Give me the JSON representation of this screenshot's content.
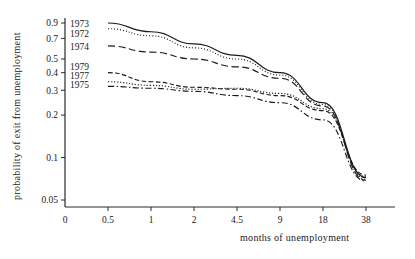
{
  "chart_data": {
    "type": "line",
    "title": "",
    "xlabel": "months of unemployment",
    "ylabel": "probability of exit from unemployment",
    "x_tick_labels": [
      "0",
      "0.5",
      "1",
      "2",
      "4.5",
      "9",
      "18",
      "38"
    ],
    "x_scale": "categorical-ordinal",
    "y_scale": "log",
    "y_tick_labels": [
      "0.9",
      "0.7",
      "0.5",
      "0.4",
      "0.3",
      "0.2",
      "0.1",
      "0.05"
    ],
    "y_tick_values": [
      0.9,
      0.7,
      0.5,
      0.4,
      0.3,
      0.2,
      0.1,
      0.05
    ],
    "ylim": [
      0.04,
      1.0
    ],
    "grid": false,
    "legend_position": "inline-left-of-curves",
    "categories": [
      "0.5",
      "1",
      "2",
      "4.5",
      "9",
      "18",
      "38"
    ],
    "series": [
      {
        "name": "1973",
        "style": "solid",
        "label": "1973",
        "values": [
          0.9,
          0.78,
          0.64,
          0.53,
          0.4,
          0.245,
          0.072
        ]
      },
      {
        "name": "1972",
        "style": "dotted",
        "label": "1972",
        "values": [
          0.82,
          0.73,
          0.6,
          0.5,
          0.385,
          0.238,
          0.07
        ]
      },
      {
        "name": "1974",
        "style": "long-dashed",
        "label": "1974",
        "values": [
          0.62,
          0.56,
          0.5,
          0.44,
          0.365,
          0.232,
          0.069
        ]
      },
      {
        "name": "1979",
        "style": "dashed",
        "label": "1979",
        "values": [
          0.4,
          0.345,
          0.315,
          0.305,
          0.275,
          0.215,
          0.075
        ]
      },
      {
        "name": "1977",
        "style": "dotted-fine",
        "label": "1977",
        "values": [
          0.345,
          0.325,
          0.305,
          0.31,
          0.285,
          0.222,
          0.073
        ]
      },
      {
        "name": "1975",
        "style": "dash-dot",
        "label": "1975",
        "values": [
          0.32,
          0.31,
          0.295,
          0.275,
          0.245,
          0.185,
          0.068
        ]
      }
    ],
    "inline_labels": [
      {
        "text": "1973",
        "series": "1973"
      },
      {
        "text": "1972",
        "series": "1972"
      },
      {
        "text": "1974",
        "series": "1974"
      },
      {
        "text": "1979",
        "series": "1979"
      },
      {
        "text": "1977",
        "series": "1977"
      },
      {
        "text": "1975",
        "series": "1975"
      }
    ]
  }
}
